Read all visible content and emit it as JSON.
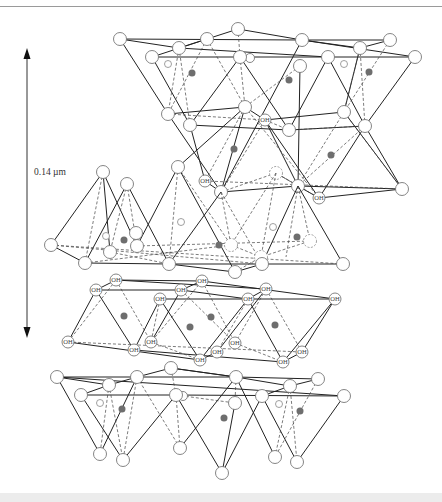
{
  "figure": {
    "scale_bar": {
      "label": "0.14 µm",
      "x": 27,
      "y_top": 48,
      "y_bottom": 338,
      "arrows": "both"
    }
  },
  "legend_semantics": {
    "large_open_circle": "oxygen",
    "oh_circle": "hydroxyl (OH)",
    "small_open_circle": "silicon",
    "filled_gray_circle": "aluminium/cation"
  },
  "layers": [
    {
      "name": "upper-tetrahedral-octahedral-sheet",
      "y_range": [
        29,
        198
      ]
    },
    {
      "name": "middle-tetrahedral-sheet",
      "y_range": [
        167,
        272
      ]
    },
    {
      "name": "gibbsite-oh-sheet",
      "y_range": [
        280,
        362
      ]
    },
    {
      "name": "lower-tetrahedral-sheet",
      "y_range": [
        368,
        473
      ]
    }
  ],
  "oh_label": "OH",
  "colors": {
    "line": "#222222",
    "atom_stroke": "#777777",
    "cation": "#6e6e6e",
    "top_rule": "#9a9a9a",
    "bottom_band": "#ececec"
  }
}
